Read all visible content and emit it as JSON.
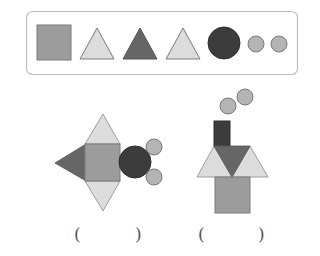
{
  "colors": {
    "medium_gray": "#9c9c9c",
    "light_gray": "#dcdcdc",
    "dark_gray": "#666666",
    "very_dark": "#3c3c3c",
    "small_circle": "#b4b4b4",
    "outline": "#7a7a7a",
    "box_border": "#bdbdbd"
  },
  "legend_box": {
    "shapes": [
      {
        "type": "square",
        "shade": "medium_gray"
      },
      {
        "type": "triangle",
        "shade": "light_gray"
      },
      {
        "type": "triangle",
        "shade": "dark_gray"
      },
      {
        "type": "triangle",
        "shade": "light_gray"
      },
      {
        "type": "circle-large",
        "shade": "very_dark"
      },
      {
        "type": "circle-small",
        "shade": "small_circle"
      },
      {
        "type": "circle-small",
        "shade": "small_circle"
      }
    ]
  },
  "figures": [
    {
      "name": "fish",
      "answer_left": "(",
      "answer_right": ")"
    },
    {
      "name": "house",
      "answer_left": "(",
      "answer_right": ")"
    }
  ]
}
